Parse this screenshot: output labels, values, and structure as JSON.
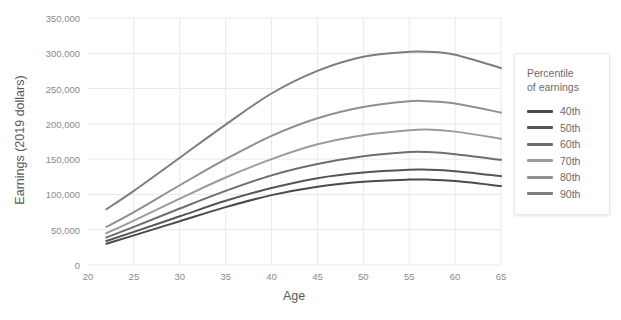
{
  "chart_data": {
    "type": "line",
    "title": "",
    "xlabel": "Age",
    "ylabel": "Earnings (2019 dollars)",
    "xlim": [
      20,
      65
    ],
    "ylim": [
      0,
      350000
    ],
    "xticks": [
      "20",
      "25",
      "30",
      "35",
      "40",
      "45",
      "50",
      "55",
      "60",
      "65"
    ],
    "yticks": [
      "0",
      "50,000",
      "100,000",
      "150,000",
      "200,000",
      "250,000",
      "300,000",
      "350,000"
    ],
    "grid": true,
    "legend_position": "right",
    "legend_title": "Percentile\nof earnings",
    "x": [
      22,
      25,
      30,
      35,
      40,
      45,
      50,
      55,
      57,
      60,
      65
    ],
    "series": [
      {
        "name": "40th",
        "color": "#4a4a4a",
        "values": [
          30000,
          42000,
          62000,
          82000,
          99000,
          111000,
          118000,
          121000,
          121000,
          119000,
          112000
        ]
      },
      {
        "name": "50th",
        "color": "#555555",
        "values": [
          34000,
          47000,
          69000,
          91000,
          109000,
          123000,
          131000,
          135000,
          135000,
          133000,
          126000
        ]
      },
      {
        "name": "60th",
        "color": "#6e6e6e",
        "values": [
          39000,
          54000,
          80000,
          105000,
          127000,
          143000,
          154000,
          160000,
          160000,
          157000,
          149000
        ]
      },
      {
        "name": "70th",
        "color": "#9b9b9b",
        "values": [
          45000,
          63000,
          94000,
          124000,
          150000,
          171000,
          184000,
          191000,
          192000,
          189000,
          179000
        ]
      },
      {
        "name": "80th",
        "color": "#8f8f8f",
        "values": [
          54000,
          75000,
          113000,
          150000,
          183000,
          208000,
          224000,
          232000,
          232000,
          229000,
          216000
        ]
      },
      {
        "name": "90th",
        "color": "#7d7d7d",
        "values": [
          79000,
          105000,
          152000,
          199000,
          243000,
          275000,
          295000,
          302000,
          302000,
          298000,
          279000
        ]
      }
    ]
  },
  "legend": {
    "title": "Percentile of earnings",
    "title_line1": "Percentile",
    "title_line2": "of earnings",
    "items": [
      {
        "label": "40th",
        "color": "#4a4a4a"
      },
      {
        "label": "50th",
        "color": "#555555"
      },
      {
        "label": "60th",
        "color": "#6e6e6e"
      },
      {
        "label": "70th",
        "color": "#9b9b9b"
      },
      {
        "label": "80th",
        "color": "#8f8f8f"
      },
      {
        "label": "90th",
        "color": "#7d7d7d"
      }
    ]
  },
  "axes": {
    "x_title": "Age",
    "y_title": "Earnings (2019 dollars)",
    "x_tick_labels": [
      "20",
      "25",
      "30",
      "35",
      "40",
      "45",
      "50",
      "55",
      "60",
      "65"
    ],
    "y_tick_labels": [
      "0",
      "50,000",
      "100,000",
      "150,000",
      "200,000",
      "250,000",
      "300,000",
      "350,000"
    ]
  },
  "colors": {
    "background": "#ffffff",
    "grid": "#e9e9e9",
    "axis_text": "#8a8a8a",
    "axis_title": "#595959",
    "legend_border": "#e8e8e8"
  }
}
